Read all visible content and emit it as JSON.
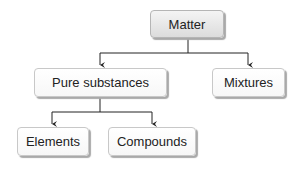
{
  "diagram": {
    "type": "hierarchy",
    "nodes": {
      "root": {
        "label": "Matter"
      },
      "pure": {
        "label": "Pure substances"
      },
      "mixtures": {
        "label": "Mixtures"
      },
      "elements": {
        "label": "Elements"
      },
      "compounds": {
        "label": "Compounds"
      }
    },
    "edges": [
      {
        "from": "Matter",
        "to": "Pure substances"
      },
      {
        "from": "Matter",
        "to": "Mixtures"
      },
      {
        "from": "Pure substances",
        "to": "Elements"
      },
      {
        "from": "Pure substances",
        "to": "Compounds"
      }
    ],
    "colors": {
      "line": "#222222",
      "root_fill": "#e4e4e4",
      "node_fill": "#fafafa",
      "shadow": "#a9a9a9"
    }
  }
}
